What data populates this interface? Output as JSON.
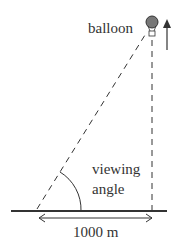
{
  "diagram": {
    "labels": {
      "balloon": "balloon",
      "viewing_line1": "viewing",
      "viewing_line2": "angle",
      "distance": "1000 m"
    },
    "icons": {
      "balloon": "hot-air-balloon-icon",
      "up_arrow": "up-arrow-icon",
      "distance_arrow": "double-headed-arrow-icon"
    },
    "colors": {
      "line": "#333333",
      "balloon_fill": "#777777",
      "background": "#ffffff"
    }
  }
}
